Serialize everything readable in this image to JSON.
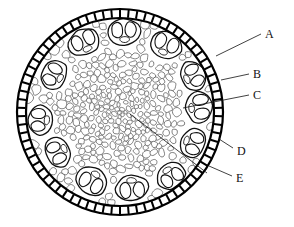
{
  "figure": {
    "kind": "botanical-cross-section-diagram",
    "background_color": "#ffffff",
    "ink_color": "#111111",
    "cell_fill_color": "#ffffff",
    "epidermis_ring_color": "#000000",
    "outline": {
      "center_x": 120,
      "center_y": 112,
      "outer_radius": 103,
      "inner_radius": 94
    },
    "labels": [
      {
        "id": "A",
        "text": "A",
        "x": 265,
        "y": 28,
        "leader": {
          "x1": 261,
          "y1": 34,
          "x2": 216,
          "y2": 56
        }
      },
      {
        "id": "B",
        "text": "B",
        "x": 253,
        "y": 68,
        "leader": {
          "x1": 249,
          "y1": 74,
          "x2": 221,
          "y2": 80
        }
      },
      {
        "id": "C",
        "text": "C",
        "x": 253,
        "y": 89,
        "leader": {
          "x1": 249,
          "y1": 95,
          "x2": 183,
          "y2": 108
        }
      },
      {
        "id": "D",
        "text": "D",
        "x": 237,
        "y": 145,
        "leader": {
          "x1": 233,
          "y1": 148,
          "x2": 219,
          "y2": 139
        }
      },
      {
        "id": "E",
        "text": "E",
        "x": 236,
        "y": 172,
        "leader": {
          "x1": 232,
          "y1": 176,
          "x2": 209,
          "y2": 166
        }
      }
    ],
    "center_leader": {
      "x1": 130,
      "y1": 114,
      "x2": 207,
      "y2": 173
    },
    "vascular_bundles": [
      {
        "cx": 124,
        "cy": 32,
        "rx": 16,
        "ry": 13,
        "rot": -3
      },
      {
        "cx": 84,
        "cy": 42,
        "rx": 16,
        "ry": 13,
        "rot": -28
      },
      {
        "cx": 166,
        "cy": 45,
        "rx": 16,
        "ry": 13,
        "rot": 22
      },
      {
        "cx": 54,
        "cy": 75,
        "rx": 15,
        "ry": 12,
        "rot": -62
      },
      {
        "cx": 193,
        "cy": 76,
        "rx": 15,
        "ry": 12,
        "rot": 62
      },
      {
        "cx": 40,
        "cy": 120,
        "rx": 15,
        "ry": 12,
        "rot": -88
      },
      {
        "cx": 199,
        "cy": 107,
        "rx": 16,
        "ry": 13,
        "rot": 84
      },
      {
        "cx": 58,
        "cy": 152,
        "rx": 15,
        "ry": 12,
        "rot": -118
      },
      {
        "cx": 193,
        "cy": 143,
        "rx": 15,
        "ry": 12,
        "rot": 112
      },
      {
        "cx": 92,
        "cy": 181,
        "rx": 16,
        "ry": 13,
        "rot": -150
      },
      {
        "cx": 132,
        "cy": 188,
        "rx": 16,
        "ry": 13,
        "rot": 176
      },
      {
        "cx": 171,
        "cy": 176,
        "rx": 15,
        "ry": 12,
        "rot": 145
      }
    ]
  }
}
